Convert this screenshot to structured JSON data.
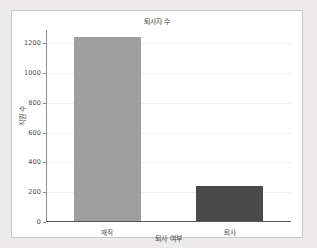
{
  "chart_data": {
    "type": "bar",
    "title": "퇴사자 수",
    "xlabel": "퇴사 여부",
    "ylabel": "직원 수",
    "categories": [
      "재직",
      "퇴사"
    ],
    "values": [
      1233,
      237
    ],
    "bar_colors": [
      "#9e9e9e",
      "#4a4a4a"
    ],
    "ylim": [
      0,
      1290
    ],
    "yticks": [
      0,
      200,
      400,
      600,
      800,
      1000,
      1200
    ],
    "ytick_labels": [
      "0",
      "200",
      "400",
      "600",
      "800",
      "1000",
      "1200"
    ],
    "grid": true,
    "legend": "none"
  },
  "figure": {
    "background_color": "#eceaea",
    "panel_color": "#ffffff",
    "panel_border_color": "#c8c8c8",
    "axis_color": "#8d8d8d",
    "grid_color": "#f0f0f0",
    "text_color": "#3d3d3d"
  }
}
